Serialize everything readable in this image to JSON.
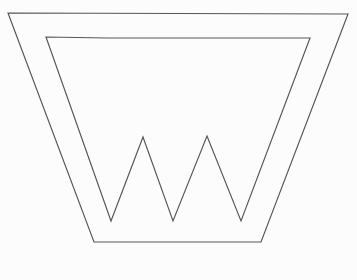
{
  "figure": {
    "title": "Geometric line drawing of a letter W inside a trapezoid",
    "background_color": "#fcfcfc",
    "stroke_color": "#56565a",
    "stroke_width": 1.15,
    "fill": "none",
    "canvas": {
      "width": 357,
      "height": 280
    },
    "shapes": [
      {
        "id": "outer-trapezoid",
        "name": "outer-trapezoid",
        "kind": "polygon",
        "closed": true,
        "description": "Large isosceles trapezoid with wide top edge and narrower bottom edge",
        "points": "8,13 348,14 261,242 94,242",
        "vertices": [
          {
            "label": "top-left",
            "x": 8,
            "y": 13
          },
          {
            "label": "top-right",
            "x": 348,
            "y": 14
          },
          {
            "label": "bottom-right",
            "x": 261,
            "y": 242
          },
          {
            "label": "bottom-left",
            "x": 94,
            "y": 242
          }
        ]
      },
      {
        "id": "inner-w",
        "name": "inner-w-shape",
        "kind": "polygon",
        "closed": true,
        "description": "Closed zig-zag W letterform nested inside the trapezoid, sharing its slanted orientation",
        "points": "46,37 111,221 143,137 173,221 207,136 241,221 310,38 172,38 108,38",
        "vertices": [
          {
            "label": "top-left",
            "x": 46,
            "y": 37
          },
          {
            "label": "valley-1",
            "x": 111,
            "y": 221
          },
          {
            "label": "peak-1",
            "x": 143,
            "y": 137
          },
          {
            "label": "valley-2",
            "x": 173,
            "y": 221
          },
          {
            "label": "peak-2",
            "x": 207,
            "y": 136
          },
          {
            "label": "valley-3",
            "x": 241,
            "y": 221
          },
          {
            "label": "top-right",
            "x": 310,
            "y": 38
          },
          {
            "label": "top-edge-node-2",
            "x": 172,
            "y": 38
          },
          {
            "label": "top-edge-node-1",
            "x": 108,
            "y": 38
          }
        ]
      }
    ]
  }
}
